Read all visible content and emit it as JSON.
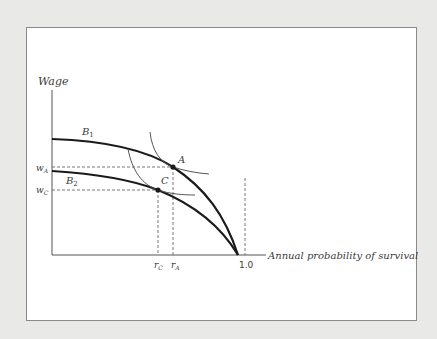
{
  "diagram": {
    "y_axis_label": "Wage",
    "x_axis_label": "Annual probability of survival",
    "x_tick_max": "1.0",
    "curves": {
      "b1": {
        "label": "B",
        "sub": "1"
      },
      "b2": {
        "label": "B",
        "sub": "2"
      }
    },
    "points": {
      "a": {
        "label": "A"
      },
      "c": {
        "label": "C"
      }
    },
    "y_ticks": {
      "wa": {
        "label": "w",
        "sub": "A"
      },
      "wc": {
        "label": "w",
        "sub": "C"
      }
    },
    "x_ticks": {
      "rc": {
        "label": "r",
        "sub": "C"
      },
      "ra": {
        "label": "r",
        "sub": "A"
      }
    },
    "colors": {
      "background": "#e9e9e7",
      "panel": "#ffffff",
      "curve": "#1a1a1a",
      "indifference": "#555555",
      "axis": "#555555"
    }
  }
}
